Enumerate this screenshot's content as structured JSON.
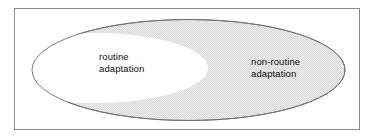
{
  "figure": {
    "name": "adaptation-continuum-diagram",
    "background_color": "#ffffff",
    "frame": {
      "border_color": "#8a8a8a",
      "fill_color": "#ffffff"
    },
    "shaded_ellipse": {
      "name": "shaded-region",
      "fill_color": "#e8e8e8",
      "stroke_color": "#6e6e6e"
    },
    "white_ellipse": {
      "name": "unshaded-region",
      "fill_color": "#ffffff"
    },
    "labels": {
      "left": {
        "line1": "routine",
        "line2": "adaptation"
      },
      "right": {
        "line1": "non-routine",
        "line2": "adaptation"
      }
    }
  }
}
